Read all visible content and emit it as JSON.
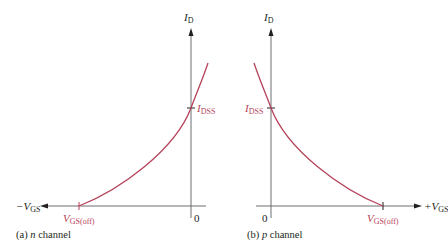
{
  "colors": {
    "axis": "#6d6e71",
    "curve": "#b5425a",
    "text": "#231f20"
  },
  "panels": [
    {
      "id": "a",
      "caption_prefix": "(a) ",
      "caption_italic": "n",
      "caption_suffix": " channel",
      "y_axis": {
        "label_main": "I",
        "label_sub": "D"
      },
      "x_axis": {
        "label_main": "−V",
        "label_sub": "GS",
        "direction": "negative"
      },
      "origin_label": "0",
      "idss": {
        "main": "I",
        "sub": "DSS"
      },
      "vgs_off": {
        "main": "V",
        "sub": "GS(off)"
      }
    },
    {
      "id": "b",
      "caption_prefix": "(b) ",
      "caption_italic": "p",
      "caption_suffix": " channel",
      "y_axis": {
        "label_main": "I",
        "label_sub": "D"
      },
      "x_axis": {
        "label_main": "+V",
        "label_sub": "GS",
        "direction": "positive"
      },
      "origin_label": "0",
      "idss": {
        "main": "I",
        "sub": "DSS"
      },
      "vgs_off": {
        "main": "V",
        "sub": "GS(off)"
      }
    }
  ]
}
